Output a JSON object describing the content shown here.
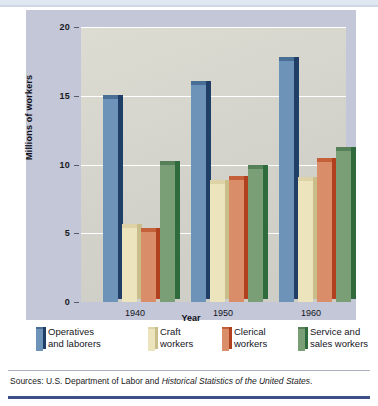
{
  "chart_data": {
    "type": "bar",
    "title": "",
    "xlabel": "Year",
    "ylabel": "Millions of workers",
    "categories": [
      "1940",
      "1950",
      "1960"
    ],
    "ylim": [
      0,
      20
    ],
    "yticks": [
      0,
      5,
      10,
      15,
      20
    ],
    "ytick_labels": [
      "0",
      "5",
      "10",
      "15",
      "20"
    ],
    "grid": true,
    "legend_position": "bottom",
    "series": [
      {
        "name": "Operatives and laborers",
        "color": "#6e93b8",
        "side_color": "#1f3f66",
        "top_color": "#4a6f96",
        "values": [
          14.8,
          15.8,
          17.5
        ]
      },
      {
        "name": "Craft workers",
        "color": "#ece4bd",
        "side_color": "#c9bd8a",
        "top_color": "#ddd3a6",
        "values": [
          5.4,
          8.6,
          8.8
        ]
      },
      {
        "name": "Clerical workers",
        "color": "#d98d68",
        "side_color": "#b1401f",
        "top_color": "#c4603a",
        "values": [
          5.1,
          8.9,
          10.2
        ]
      },
      {
        "name": "Service and sales workers",
        "color": "#7a9e76",
        "side_color": "#2f6b3c",
        "top_color": "#558058",
        "values": [
          10.0,
          9.7,
          11.0
        ]
      }
    ]
  },
  "legend": [
    {
      "label_line1": "Operatives",
      "label_line2": "and laborers",
      "swatch": "legend-swatch-operatives"
    },
    {
      "label_line1": "Craft",
      "label_line2": "workers",
      "swatch": "legend-swatch-craft"
    },
    {
      "label_line1": "Clerical",
      "label_line2": "workers",
      "swatch": "legend-swatch-clerical"
    },
    {
      "label_line1": "Service and",
      "label_line2": "sales workers",
      "swatch": "legend-swatch-service"
    }
  ],
  "source": {
    "prefix": "Sources: U.S. Department of Labor and ",
    "italic": "Historical Statistics of the United States",
    "suffix": "."
  },
  "colors": {
    "panel_background": "#c3c7d8",
    "plot_background": "#d6d6cf",
    "gridline": "#ffffff",
    "rule": "#3c4f86"
  }
}
